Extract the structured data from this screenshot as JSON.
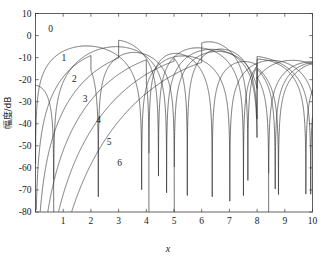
{
  "figure": {
    "background": "#ffffff",
    "curve_color": "#2b2b2b",
    "frame_color": "#3a3a3a"
  },
  "chart_data": {
    "type": "line",
    "title": "",
    "xlabel": "x",
    "ylabel": "幅度/dB",
    "xlim": [
      0,
      10
    ],
    "ylim": [
      -80,
      10
    ],
    "grid": false,
    "legend": "inline-curve-labels",
    "xticks": [
      0,
      1,
      2,
      3,
      4,
      5,
      6,
      7,
      8,
      9,
      10
    ],
    "xticklabels": [
      "",
      "1",
      "2",
      "3",
      "4",
      "5",
      "6",
      "7",
      "8",
      "9",
      "10"
    ],
    "yticks": [
      10,
      0,
      -10,
      -20,
      -30,
      -40,
      -50,
      -60,
      -70,
      -80
    ],
    "yticklabels": [
      "10",
      "0",
      "-10",
      "-20",
      "-30",
      "-40",
      "-50",
      "-60",
      "-70",
      "-80"
    ],
    "series": [
      {
        "name": "0",
        "order": 0,
        "label_position": {
          "x": 0.55,
          "y": 3.0
        },
        "zeros": [
          2.405,
          5.52,
          8.654
        ],
        "peaks_db": [
          0.0,
          -13.0,
          -16.0,
          -17.8
        ],
        "peak_x": [
          0.0,
          3.83,
          7.02,
          10.0
        ]
      },
      {
        "name": "1",
        "order": 1,
        "label_position": {
          "x": 1.02,
          "y": -10.0
        },
        "zeros": [
          3.832,
          7.016,
          10.173
        ],
        "peaks_db": [
          -4.6,
          -15.2,
          -17.5
        ],
        "peak_x": [
          1.84,
          5.33,
          8.54
        ]
      },
      {
        "name": "2",
        "order": 2,
        "label_position": {
          "x": 1.4,
          "y": -19.5
        },
        "zeros": [
          5.136,
          8.417
        ],
        "peaks_db": [
          -7.8,
          -17.1,
          -19.0
        ],
        "peak_x": [
          3.05,
          6.71,
          9.97
        ]
      },
      {
        "name": "3",
        "order": 3,
        "label_position": {
          "x": 1.79,
          "y": -28.5
        },
        "zeros": [
          6.38,
          9.761
        ],
        "peaks_db": [
          -10.4,
          -18.5
        ],
        "peak_x": [
          4.2,
          8.02
        ]
      },
      {
        "name": "4",
        "order": 4,
        "label_position": {
          "x": 2.28,
          "y": -38.0
        },
        "zeros": [
          7.588
        ],
        "peaks_db": [
          -12.6,
          -19.8
        ],
        "peak_x": [
          5.32,
          9.28
        ]
      },
      {
        "name": "5",
        "order": 5,
        "label_position": {
          "x": 2.66,
          "y": -48.0
        },
        "zeros": [
          8.771
        ],
        "peaks_db": [
          -14.5
        ],
        "peak_x": [
          6.42
        ]
      },
      {
        "name": "6",
        "order": 6,
        "label_position": {
          "x": 3.04,
          "y": -57.5
        },
        "zeros": [
          9.936
        ],
        "peaks_db": [
          -16.2
        ],
        "peak_x": [
          7.5
        ]
      }
    ]
  }
}
